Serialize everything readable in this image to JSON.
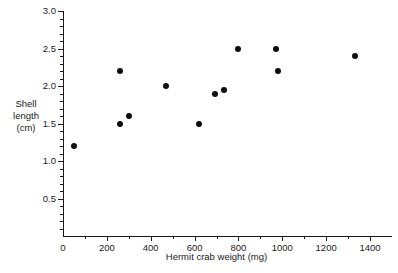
{
  "chart_data": {
    "type": "scatter",
    "title": "",
    "xlabel": "Hermit crab weight (mg)",
    "ylabel": "Shell length (cm)",
    "ylabel_lines": [
      "Shell",
      "length",
      "(cm)"
    ],
    "xlim": [
      0,
      1400
    ],
    "ylim": [
      0,
      3.0
    ],
    "grid": false,
    "legend": null,
    "x_ticks": [
      0,
      200,
      400,
      600,
      800,
      1000,
      1200,
      1400
    ],
    "x_tick_labels": [
      "0",
      "200",
      "400",
      "600",
      "800",
      "1000",
      "1200",
      "1400"
    ],
    "x_minor_step": 100,
    "y_ticks": [
      0.5,
      1.0,
      1.5,
      2.0,
      2.5,
      3.0
    ],
    "y_tick_labels": [
      "0.5",
      "1.0",
      "1.5",
      "2.0",
      "2.5",
      "3.0"
    ],
    "y_minor_step": 0.1,
    "marker": "filled-circle",
    "marker_color": "#0d0d0d",
    "points": [
      {
        "x": 50,
        "y": 1.2
      },
      {
        "x": 260,
        "y": 2.2
      },
      {
        "x": 260,
        "y": 1.5
      },
      {
        "x": 300,
        "y": 1.6
      },
      {
        "x": 470,
        "y": 2.0
      },
      {
        "x": 620,
        "y": 1.5
      },
      {
        "x": 695,
        "y": 1.9
      },
      {
        "x": 735,
        "y": 1.95
      },
      {
        "x": 800,
        "y": 2.5
      },
      {
        "x": 970,
        "y": 2.5
      },
      {
        "x": 980,
        "y": 2.2
      },
      {
        "x": 1330,
        "y": 2.4
      }
    ]
  },
  "axis_colors": {
    "line": "#1a1a1a",
    "text": "#1a1a1a",
    "background": "#ffffff"
  }
}
